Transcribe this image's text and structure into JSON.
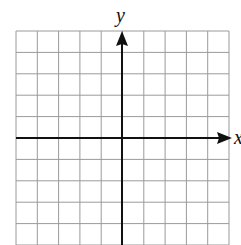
{
  "diagram": {
    "type": "coordinate-plane",
    "x_axis_label": "x",
    "y_axis_label": "y",
    "grid": {
      "columns": 10,
      "rows": 10,
      "left": 16,
      "top": 31,
      "cell_width": 21.3,
      "cell_height": 21.4,
      "line_color": "#9a9a9a"
    },
    "axes": {
      "color": "#111111",
      "origin_x": 122,
      "origin_y": 138
    }
  }
}
